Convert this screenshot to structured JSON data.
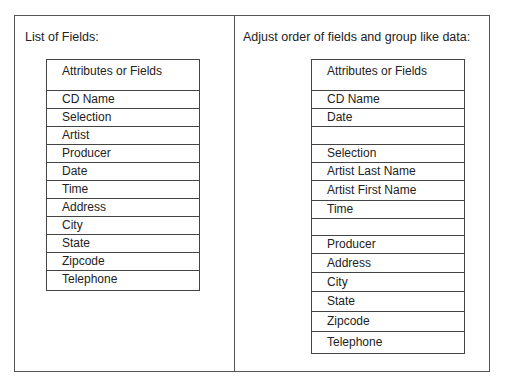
{
  "left": {
    "caption": "List of Fields:",
    "header": "Attributes or Fields",
    "rows": [
      "CD Name",
      "Selection",
      "Artist",
      "Producer",
      "Date",
      "Time",
      "Address",
      "City",
      "State",
      "Zipcode",
      "Telephone"
    ]
  },
  "right": {
    "caption": "Adjust order of fields and group like data:",
    "header": "Attributes or Fields",
    "rows": [
      "CD Name",
      "Date",
      "",
      "Selection",
      "Artist Last Name",
      "Artist First Name",
      "Time",
      "",
      "Producer",
      "Address",
      "City",
      "State",
      "Zipcode",
      "Telephone"
    ]
  }
}
